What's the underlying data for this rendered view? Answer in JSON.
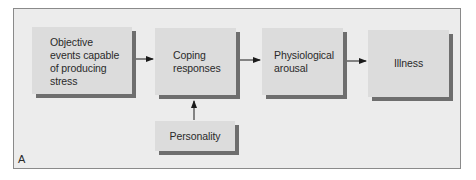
{
  "diagram": {
    "panel_label": "A",
    "nodes": [
      {
        "id": "events",
        "label": "Objective events capable of producing stress",
        "lines": [
          "Objective",
          "events capable",
          "of producing",
          "stress"
        ]
      },
      {
        "id": "coping",
        "label": "Coping responses",
        "lines": [
          "Coping",
          "responses"
        ]
      },
      {
        "id": "arousal",
        "label": "Physiological arousal",
        "lines": [
          "Physiological",
          "arousal"
        ]
      },
      {
        "id": "illness",
        "label": "Illness",
        "lines": [
          "Illness"
        ]
      },
      {
        "id": "personality",
        "label": "Personality",
        "lines": [
          "Personality"
        ]
      }
    ],
    "edges": [
      {
        "from": "events",
        "to": "coping"
      },
      {
        "from": "coping",
        "to": "arousal"
      },
      {
        "from": "arousal",
        "to": "illness"
      },
      {
        "from": "personality",
        "to": "coping"
      }
    ],
    "colors": {
      "background": "#ececec",
      "box_fill": "#dcdcdc",
      "box_shadow": "#6e6e6e",
      "frame_border": "#8a8a8a",
      "arrow": "#1a1a1a"
    }
  }
}
